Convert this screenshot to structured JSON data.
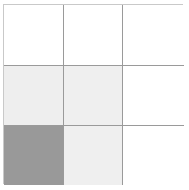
{
  "figure": {
    "background_color": "#ffffff",
    "border_color": "#c9c9c9",
    "gridline_color": "#9a9a9a"
  },
  "palette": {
    "empty": "#ffffff",
    "light": "#eeeeee",
    "dark": "#999999"
  },
  "chart_data": {
    "type": "heatmap",
    "title": "",
    "subtitle": "",
    "xlabel": "",
    "ylabel": "",
    "columns": 3,
    "rows": 3,
    "categories": [
      "col-1",
      "col-2",
      "col-3"
    ],
    "row_labels": [
      "row-1",
      "row-2",
      "row-3"
    ],
    "xtick_labels": [],
    "ytick_labels": [],
    "legend": [],
    "grid": true,
    "values": [
      [
        0,
        0,
        0
      ],
      [
        1,
        1,
        0
      ],
      [
        2,
        1,
        0
      ]
    ],
    "value_colors": {
      "0": "#ffffff",
      "1": "#eeeeee",
      "2": "#999999"
    },
    "shaded_cell_count": 4,
    "cells": [
      {
        "id": "r1c1",
        "row": 1,
        "col": 1,
        "shade": "empty",
        "color": "#ffffff",
        "value": 0
      },
      {
        "id": "r1c2",
        "row": 1,
        "col": 2,
        "shade": "empty",
        "color": "#ffffff",
        "value": 0
      },
      {
        "id": "r1c3",
        "row": 1,
        "col": 3,
        "shade": "empty",
        "color": "#ffffff",
        "value": 0
      },
      {
        "id": "r2c1",
        "row": 2,
        "col": 1,
        "shade": "light",
        "color": "#eeeeee",
        "value": 1
      },
      {
        "id": "r2c2",
        "row": 2,
        "col": 2,
        "shade": "light",
        "color": "#efefef",
        "value": 1
      },
      {
        "id": "r2c3",
        "row": 2,
        "col": 3,
        "shade": "empty",
        "color": "#ffffff",
        "value": 0
      },
      {
        "id": "r3c1",
        "row": 3,
        "col": 1,
        "shade": "dark",
        "color": "#999999",
        "value": 2
      },
      {
        "id": "r3c2",
        "row": 3,
        "col": 2,
        "shade": "light",
        "color": "#efefef",
        "value": 1
      },
      {
        "id": "r3c3",
        "row": 3,
        "col": 3,
        "shade": "empty",
        "color": "#ffffff",
        "value": 0
      }
    ]
  }
}
